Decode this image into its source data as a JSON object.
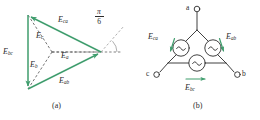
{
  "figure": {
    "kind": "two-panel-engineering-figure",
    "colors": {
      "phasor_green": "#3f9d6d",
      "arrow_green": "#3f9d6d",
      "line_black": "#2b2b2b",
      "dashed_black": "#4a4a4a",
      "background": "#ffffff"
    }
  },
  "panel_a": {
    "caption": "(a)",
    "type": "phasor-diagram",
    "description": "Equilateral phasor triangle of line voltages with phase voltages from centroid",
    "line_phasors": [
      {
        "id": "Eca",
        "base": "E",
        "sub": "ca",
        "label_x": 58,
        "label_y": 17
      },
      {
        "id": "Ebc",
        "base": "E",
        "sub": "bc",
        "label_x": 4,
        "label_y": 50
      },
      {
        "id": "Eab",
        "base": "E",
        "sub": "ab",
        "label_x": 60,
        "label_y": 78
      }
    ],
    "phase_phasors": [
      {
        "id": "Ec",
        "base": "E",
        "sub": "c",
        "label_x": 36,
        "label_y": 33
      },
      {
        "id": "Eb",
        "base": "E",
        "sub": "b",
        "label_x": 31,
        "label_y": 62
      },
      {
        "id": "Ea",
        "base": "E",
        "sub": "a",
        "label_x": 61,
        "label_y": 52
      }
    ],
    "angle_annotation": {
      "numerator": "π",
      "denominator": "6",
      "value_radians": 0.5236,
      "value_degrees": 30,
      "label_x": 96,
      "label_y": 11
    },
    "geometry": {
      "vertex_top_left": [
        28,
        15
      ],
      "vertex_bottom_left": [
        28,
        89
      ],
      "vertex_right": [
        101,
        52
      ],
      "centroid": [
        52,
        52
      ]
    }
  },
  "panel_b": {
    "caption": "(b)",
    "type": "circuit-schematic",
    "description": "Delta-connected three-phase AC source with terminals a, b, c",
    "terminals": [
      {
        "id": "a",
        "label": "a",
        "label_x": 190,
        "label_y": 4,
        "node_x": 203,
        "node_y": 8
      },
      {
        "id": "b",
        "label": "b",
        "label_x": 240,
        "label_y": 69,
        "node_x": 233,
        "node_y": 72
      },
      {
        "id": "c",
        "label": "c",
        "label_x": 146,
        "label_y": 69,
        "node_x": 158,
        "node_y": 72
      }
    ],
    "sources": [
      {
        "id": "Eca",
        "base": "E",
        "sub": "ca",
        "symbol": "ac-source-icon",
        "cx": 181,
        "cy": 48,
        "label_x": 150,
        "label_y": 34,
        "arrow": "down-left"
      },
      {
        "id": "Eab",
        "base": "E",
        "sub": "ab",
        "symbol": "ac-source-icon",
        "cx": 213,
        "cy": 48,
        "label_x": 222,
        "label_y": 34,
        "arrow": "down-right"
      },
      {
        "id": "Ebc",
        "base": "E",
        "sub": "bc",
        "symbol": "ac-source-icon",
        "cx": 197,
        "cy": 69,
        "label_x": 186,
        "label_y": 85,
        "arrow": "right"
      }
    ]
  }
}
